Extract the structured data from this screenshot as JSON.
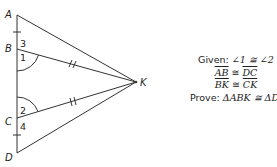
{
  "figure": {
    "points": {
      "A": {
        "label": "A",
        "x": 17,
        "y": 15
      },
      "B": {
        "label": "B",
        "x": 17,
        "y": 49
      },
      "C": {
        "label": "C",
        "x": 17,
        "y": 118
      },
      "D": {
        "label": "D",
        "x": 17,
        "y": 153
      },
      "K": {
        "label": "K",
        "x": 136,
        "y": 82
      }
    },
    "angle_labels": {
      "a1": "1",
      "a2": "2",
      "a3": "3",
      "a4": "4"
    }
  },
  "given_block": {
    "given_prefix": "Given: ",
    "angle_statement": "∠1 ≅ ∠2",
    "seg1_left": "AB",
    "seg1_op": " ≅ ",
    "seg1_right": "DC",
    "seg2_left": "BK",
    "seg2_op": " ≅ ",
    "seg2_right": "CK",
    "prove_prefix": "Prove: ",
    "prove_statement": "ΔABK ≅ ΔDCK"
  }
}
